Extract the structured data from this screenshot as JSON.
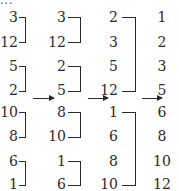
{
  "diagram": {
    "title_fragment": "...",
    "type": "merge-sort-bottom-up",
    "columns": [
      {
        "values": [
          "3",
          "12",
          "5",
          "2",
          "10",
          "8",
          "6",
          "1"
        ],
        "groups": [
          [
            0,
            1
          ],
          [
            2,
            3
          ],
          [
            4,
            5
          ],
          [
            6,
            7
          ]
        ]
      },
      {
        "values": [
          "3",
          "12",
          "2",
          "5",
          "8",
          "10",
          "1",
          "6"
        ],
        "groups": [
          [
            0,
            1
          ],
          [
            2,
            3
          ],
          [
            4,
            5
          ],
          [
            6,
            7
          ]
        ]
      },
      {
        "values": [
          "2",
          "3",
          "5",
          "12",
          "1",
          "6",
          "8",
          "10"
        ],
        "groups": [
          [
            0,
            3
          ],
          [
            4,
            7
          ]
        ]
      },
      {
        "values": [
          "1",
          "2",
          "3",
          "5",
          "6",
          "8",
          "10",
          "12"
        ],
        "groups": []
      }
    ],
    "arrows": [
      "col1-to-col2",
      "col2-to-col3",
      "col3-to-col4"
    ]
  }
}
